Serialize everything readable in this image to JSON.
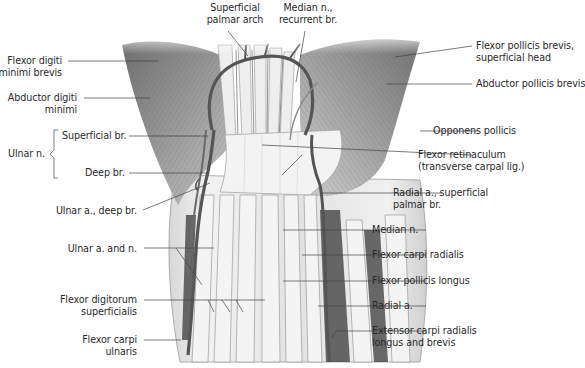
{
  "figure": {
    "colors": {
      "background": "#ffffff",
      "label_text": "#2a2a2a",
      "leader_line": "#444444",
      "muscle": "#8a8a8a",
      "tendon": "#e6e6e6",
      "vessel": "#555555",
      "retinaculum": "#efefef"
    }
  },
  "labels": {
    "top": [
      {
        "id": "superficial-palmar-arch",
        "line1": "Superficial",
        "line2": "palmar arch"
      },
      {
        "id": "median-n-recurrent-br",
        "line1": "Median n.,",
        "line2": "recurrent br."
      }
    ],
    "left": [
      {
        "id": "flexor-digiti-minimi-brevis",
        "line1": "Flexor digiti",
        "line2": "minimi brevis"
      },
      {
        "id": "abductor-digiti-minimi",
        "line1": "Abductor digiti",
        "line2": "minimi"
      },
      {
        "id": "superficial-br",
        "line1": "Superficial br.",
        "line2": ""
      },
      {
        "id": "deep-br",
        "line1": "Deep br.",
        "line2": ""
      },
      {
        "id": "ulnar-a-deep-br",
        "line1": "Ulnar a., deep br.",
        "line2": ""
      },
      {
        "id": "ulnar-a-and-n",
        "line1": "Ulnar a. and n.",
        "line2": ""
      },
      {
        "id": "flexor-digitorum-superficialis",
        "line1": "Flexor digitorum",
        "line2": "superficialis"
      },
      {
        "id": "flexor-carpi-ulnaris",
        "line1": "Flexor carpi",
        "line2": "ulnaris"
      }
    ],
    "group": {
      "id": "ulnar-n",
      "text": "Ulnar n."
    },
    "right": [
      {
        "id": "flexor-pollicis-brevis-superficial-head",
        "line1": "Flexor pollicis brevis,",
        "line2": "superficial head"
      },
      {
        "id": "abductor-pollicis-brevis",
        "line1": "Abductor pollicis brevis",
        "line2": ""
      },
      {
        "id": "opponens-pollicis",
        "line1": "Opponens pollicis",
        "line2": ""
      },
      {
        "id": "flexor-retinaculum",
        "line1": "Flexor retinaculum",
        "line2": "(transverse carpal lig.)"
      },
      {
        "id": "radial-a-superficial-palmar-br",
        "line1": "Radial a., superficial",
        "line2": "palmar br."
      },
      {
        "id": "median-n",
        "line1": "Median n.",
        "line2": ""
      },
      {
        "id": "flexor-carpi-radialis",
        "line1": "Flexor carpi radialis",
        "line2": ""
      },
      {
        "id": "flexor-pollicis-longus",
        "line1": "Flexor pollicis longus",
        "line2": ""
      },
      {
        "id": "radial-a",
        "line1": "Radial a.",
        "line2": ""
      },
      {
        "id": "extensor-carpi-radialis-longus-brevis",
        "line1": "Extensor carpi radialis",
        "line2": "longus and brevis"
      }
    ]
  }
}
